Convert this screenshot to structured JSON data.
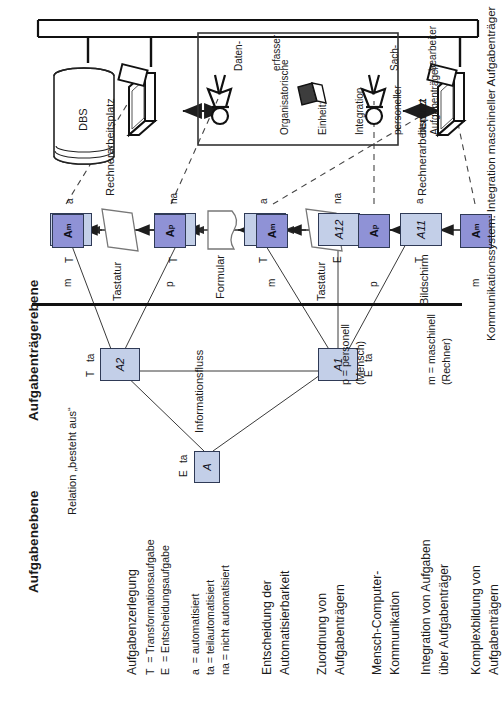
{
  "diagram": {
    "title_left": "Aufgabenebene",
    "title_right": "Aufgabenträgerebene",
    "right_side_caption": "Kommunikationssystem: Integration maschineller Aufgabenträger",
    "relation_label": "Relation „besteht aus“",
    "information_flow_label": "Informationsfluss"
  },
  "task_boxes": [
    {
      "id": "A",
      "label": "A"
    },
    {
      "id": "A1",
      "label": "A1"
    },
    {
      "id": "A2",
      "label": "A2"
    },
    {
      "id": "A11",
      "label": "A11"
    },
    {
      "id": "A12",
      "label": "A12"
    },
    {
      "id": "A13",
      "label": "A13"
    },
    {
      "id": "A21",
      "label": "A21"
    },
    {
      "id": "A22",
      "label": "A22"
    }
  ],
  "task_type_labels": {
    "A_type": "E",
    "A_auto": "ta",
    "A1_type": "E",
    "A1_auto": "ta",
    "A2_type": "T",
    "A2_auto": "ta",
    "A11_type": "T",
    "A11_auto": "a",
    "A12_type": "E",
    "A12_auto": "na",
    "A13_type": "T",
    "A13_auto": "a",
    "A21_type": "T",
    "A21_auto": "na",
    "A22_type": "T",
    "A22_auto": "a"
  },
  "bearer_boxes": [
    {
      "id": "Am1",
      "letter": "A",
      "sub": "m"
    },
    {
      "id": "Ap1",
      "letter": "A",
      "sub": "p"
    },
    {
      "id": "Am2",
      "letter": "A",
      "sub": "m"
    },
    {
      "id": "Ap2",
      "letter": "A",
      "sub": "p"
    },
    {
      "id": "Am3",
      "letter": "A",
      "sub": "m"
    }
  ],
  "bearer_kind_labels": [
    "m",
    "p",
    "m",
    "p",
    "m"
  ],
  "media_labels": {
    "tastatur_top": "Tastatur",
    "formular": "Formular",
    "tastatur_mid": "Tastatur",
    "bildschirm": "Bildschirm"
  },
  "workplace_labels": {
    "rechnerarbeitsplatz_top": "Rechnerarbeitsplatz",
    "rechnerarbeitsplatz_bottom": "Rechnerarbeitsplatz",
    "benutzt": "benutzt"
  },
  "org_unit": {
    "line1": "Organisatorische",
    "line2": "Einheit:",
    "line3": "Integration",
    "line4": "personeller",
    "line5": "Aufgabenträger",
    "person_top_l1": "Daten-",
    "person_top_l2": "erfasser",
    "person_bottom_l1": "Sach-",
    "person_bottom_l2": "bearbeiter"
  },
  "dbs_label": "DBS",
  "legend": {
    "block1_title": "Aufgabenzerlegung",
    "block1_l1": "T  = Transformationsaufgabe",
    "block1_l2": "E  = Entscheidungsaufgabe",
    "block1_l3": "a  = automatisiert",
    "block1_l4": "ta = teilautomatisiert",
    "block1_l5": "na = nicht automatisiert",
    "block2_l1": "Entscheidung der",
    "block2_l2": "Automatisierbarkeit",
    "block3_l1": "Zuordnung von",
    "block3_l2": "Aufgabenträgern",
    "block4_l1": "Mensch-Computer-",
    "block4_l2": "Kommunikation",
    "block5_l1": "Integration von Aufgaben",
    "block5_l2": "über Aufgabenträger",
    "block6_l1": "Komplexbildung von",
    "block6_l2": "Aufgabenträgern",
    "key_m_l1": "m = maschinell",
    "key_m_l2": "(Rechner)",
    "key_p_l1": "p = personell",
    "key_p_l2": "(Mensch)"
  },
  "colors": {
    "task_box_fill": "#c3cfe8",
    "bearer_box_fill": "#8f92d6",
    "box_border": "#2f3a56",
    "line": "#3a3a3a",
    "frame_border": "#b9b9b9"
  }
}
